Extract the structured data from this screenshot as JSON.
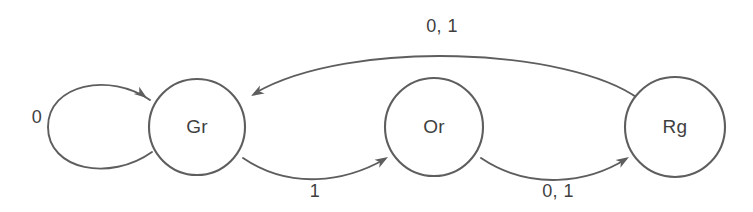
{
  "diagram": {
    "type": "finite-state-machine",
    "background_color": "#ffffff",
    "stroke_color": "#5e5e5e",
    "text_color": "#3f3f3f",
    "states": [
      {
        "id": "Gr",
        "label": "Gr",
        "cx": 197,
        "cy": 127,
        "r": 48
      },
      {
        "id": "Or",
        "label": "Or",
        "cx": 434,
        "cy": 127,
        "r": 49
      },
      {
        "id": "Rg",
        "label": "Rg",
        "cx": 675,
        "cy": 127,
        "r": 50
      }
    ],
    "transitions": [
      {
        "id": "gr-self",
        "from": "Gr",
        "to": "Gr",
        "label": "0",
        "label_x": 37,
        "label_y": 118,
        "kind": "self-loop",
        "path": "M 152 152 C 110 182 48 170 48 127 C 48 84 110 72 150 100",
        "arrow_x": 147,
        "arrow_y": 98,
        "arrow_angle": 36
      },
      {
        "id": "gr-to-or",
        "from": "Gr",
        "to": "Or",
        "label": "1",
        "label_x": 315,
        "label_y": 192,
        "kind": "arc",
        "path": "M 243 158 C 290 190 345 182 385 159",
        "arrow_x": 388,
        "arrow_y": 157,
        "arrow_angle": -31
      },
      {
        "id": "or-to-rg",
        "from": "Or",
        "to": "Rg",
        "label": "0, 1",
        "label_x": 558,
        "label_y": 192,
        "kind": "arc",
        "path": "M 481 158 C 530 191 588 183 626 159",
        "arrow_x": 629,
        "arrow_y": 157,
        "arrow_angle": -32
      },
      {
        "id": "rg-to-gr",
        "from": "Rg",
        "to": "Gr",
        "label": "0, 1",
        "label_x": 442,
        "label_y": 27,
        "kind": "arc",
        "path": "M 639 99 C 570 48 350 38 255 93",
        "arrow_x": 251,
        "arrow_y": 96,
        "arrow_angle": 150
      }
    ]
  }
}
